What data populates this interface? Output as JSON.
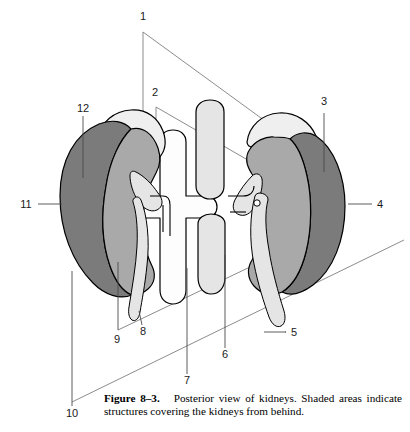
{
  "figure": {
    "caption_label": "Figure 8–3.",
    "caption_text": "Posterior view of kidneys. Shaded areas indicate structures covering the kidneys from behind."
  },
  "colors": {
    "adrenal_light": "#efefef",
    "kidney_body": "#a9a9a9",
    "kidney_dark_band": "#7b7b7b",
    "vessel_light": "#e5e5e5",
    "vessel_white": "#fdfdfd",
    "outline": "#000000",
    "leader": "#6e6e6e",
    "page_background": "#ffffff"
  },
  "labels": [
    {
      "id": "1",
      "text": "1",
      "x": 143,
      "y": 20
    },
    {
      "id": "2",
      "text": "2",
      "x": 155,
      "y": 96
    },
    {
      "id": "3",
      "text": "3",
      "x": 321,
      "y": 105
    },
    {
      "id": "4",
      "text": "4",
      "x": 378,
      "y": 207
    },
    {
      "id": "5",
      "text": "5",
      "x": 292,
      "y": 336
    },
    {
      "id": "6",
      "text": "6",
      "x": 222,
      "y": 355
    },
    {
      "id": "7",
      "text": "7",
      "x": 184,
      "y": 381
    },
    {
      "id": "8",
      "text": "8",
      "x": 141,
      "y": 332
    },
    {
      "id": "9",
      "text": "9",
      "x": 114,
      "y": 340
    },
    {
      "id": "10",
      "text": "10",
      "x": 67,
      "y": 414
    },
    {
      "id": "11",
      "text": "11",
      "x": 23,
      "y": 207
    },
    {
      "id": "12",
      "text": "12",
      "x": 79,
      "y": 108
    }
  ],
  "structures": [
    {
      "name": "left-adrenal-gland",
      "shade": "adrenal_light"
    },
    {
      "name": "right-adrenal-gland",
      "shade": "adrenal_light"
    },
    {
      "name": "left-kidney",
      "shade": "kidney_body"
    },
    {
      "name": "right-kidney",
      "shade": "kidney_body"
    },
    {
      "name": "left-kidney-shaded-band",
      "shade": "kidney_dark_band"
    },
    {
      "name": "right-kidney-shaded-band",
      "shade": "kidney_dark_band"
    },
    {
      "name": "aorta",
      "shade": "vessel_white"
    },
    {
      "name": "inferior-vena-cava",
      "shade": "vessel_light"
    },
    {
      "name": "left-ureter",
      "shade": "vessel_light"
    },
    {
      "name": "right-ureter",
      "shade": "vessel_light"
    }
  ]
}
